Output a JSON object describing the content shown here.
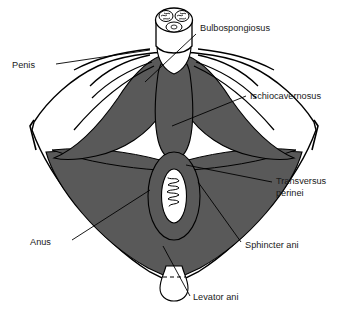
{
  "figure": {
    "background_color": "#ffffff",
    "muscle_fill_color": "#595959",
    "outline_color": "#000000",
    "label_color": "#1a1a1a",
    "white_fill_color": "#ffffff",
    "leader_line_color": "#000000"
  },
  "labels": [
    {
      "id": "penis",
      "text": "Penis",
      "x": 12,
      "y": 68,
      "anchor": "start",
      "side": "left",
      "points_to": "penis-cross-section"
    },
    {
      "id": "bulbospongiosus",
      "text": "Bulbospongiosus",
      "x": 200,
      "y": 31,
      "anchor": "start",
      "side": "right",
      "points_to": "bulbospongiosus-muscle"
    },
    {
      "id": "ischiocavernosus",
      "text": "Ischiocavernosus",
      "x": 250,
      "y": 99,
      "anchor": "start",
      "side": "right",
      "points_to": "ischiocavernosus-muscle-right"
    },
    {
      "id": "transversus-perinei-line1",
      "text": "Transversus",
      "x": 276,
      "y": 184,
      "anchor": "start",
      "side": "right",
      "points_to": "transversus-perinei-muscle"
    },
    {
      "id": "transversus-perinei-line2",
      "text": "perinei",
      "x": 276,
      "y": 196,
      "anchor": "start",
      "side": "right",
      "points_to": "transversus-perinei-muscle"
    },
    {
      "id": "anus",
      "text": "Anus",
      "x": 30,
      "y": 245,
      "anchor": "start",
      "side": "left",
      "points_to": "anus-opening"
    },
    {
      "id": "sphincter-ani",
      "text": "Sphincter ani",
      "x": 245,
      "y": 248,
      "anchor": "start",
      "side": "right",
      "points_to": "sphincter-ani-muscle"
    },
    {
      "id": "levator-ani",
      "text": "Levator ani",
      "x": 193,
      "y": 300,
      "anchor": "start",
      "side": "right",
      "points_to": "levator-ani-muscle"
    }
  ],
  "structures": [
    {
      "id": "penis-cross-section",
      "name": "Penis cross-section",
      "description": "Elliptical cut end of penis showing two corpora cavernosa above and one corpus spongiosum below"
    },
    {
      "id": "bulbospongiosus-muscle",
      "name": "Bulbospongiosus",
      "description": "Central elongated teardrop muscle in midline"
    },
    {
      "id": "ischiocavernosus-muscle-left",
      "name": "Ischiocavernosus (left)",
      "description": "Diverging muscle band on left"
    },
    {
      "id": "ischiocavernosus-muscle-right",
      "name": "Ischiocavernosus (right)",
      "description": "Diverging muscle band on right"
    },
    {
      "id": "transversus-perinei-muscle",
      "name": "Transversus perinei",
      "description": "Transverse band across perineum"
    },
    {
      "id": "sphincter-ani-muscle",
      "name": "Sphincter ani",
      "description": "Ring of muscle encircling the anus"
    },
    {
      "id": "levator-ani-muscle",
      "name": "Levator ani",
      "description": "Broad fan-shaped sheet forming pelvic floor"
    },
    {
      "id": "anus-opening",
      "name": "Anus",
      "description": "White vertical ellipse with mucosal folds"
    },
    {
      "id": "coccyx",
      "name": "Coccyx",
      "description": "White bulbous shape at lower midline"
    }
  ]
}
